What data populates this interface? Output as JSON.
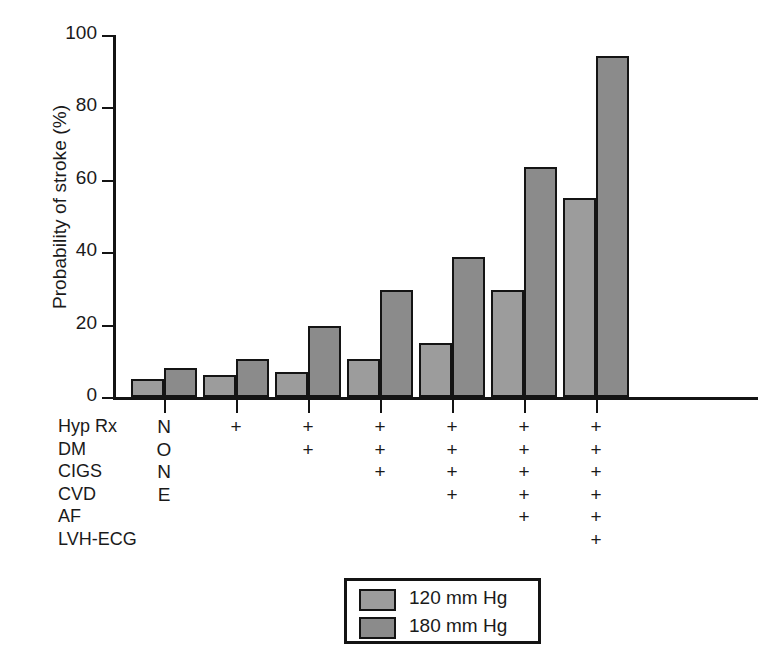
{
  "chart_data": {
    "type": "bar",
    "title": "",
    "xlabel": "",
    "ylabel": "Probability of stroke (%)",
    "ylim": [
      0,
      100
    ],
    "yticks": [
      0,
      20,
      40,
      60,
      80,
      100
    ],
    "ytick_labels": [
      "0",
      "20",
      "40",
      "60",
      "80",
      "100"
    ],
    "grid": false,
    "legend_position": "bottom-center",
    "categories": [
      "1",
      "2",
      "3",
      "4",
      "5",
      "6",
      "7"
    ],
    "series": [
      {
        "name": "120 mm Hg",
        "color": "#9c9c9c",
        "values": [
          5,
          6,
          7,
          10.5,
          15,
          29.5,
          55
        ]
      },
      {
        "name": "180 mm Hg",
        "color": "#8b8b8b",
        "values": [
          8,
          10.5,
          19.5,
          29.5,
          38.7,
          63.5,
          94.3
        ]
      }
    ],
    "risk_factor_table": {
      "row_labels": [
        "Hyp Rx",
        "DM",
        "CIGS",
        "CVD",
        "AF",
        "LVH-ECG"
      ],
      "baseline_label": "NONE",
      "baseline_letters": [
        "N",
        "O",
        "N",
        "E"
      ],
      "plus_symbol": "+",
      "columns": [
        {
          "category": "1",
          "marks": [
            false,
            false,
            false,
            false,
            false,
            false
          ]
        },
        {
          "category": "2",
          "marks": [
            true,
            false,
            false,
            false,
            false,
            false
          ]
        },
        {
          "category": "3",
          "marks": [
            true,
            true,
            false,
            false,
            false,
            false
          ]
        },
        {
          "category": "4",
          "marks": [
            true,
            true,
            true,
            false,
            false,
            false
          ]
        },
        {
          "category": "5",
          "marks": [
            true,
            true,
            true,
            true,
            false,
            false
          ]
        },
        {
          "category": "6",
          "marks": [
            true,
            true,
            true,
            true,
            true,
            false
          ]
        },
        {
          "category": "7",
          "marks": [
            true,
            true,
            true,
            true,
            true,
            true
          ]
        }
      ]
    }
  },
  "legend": {
    "entries": [
      {
        "label": "120 mm Hg"
      },
      {
        "label": "180 mm Hg"
      }
    ]
  }
}
